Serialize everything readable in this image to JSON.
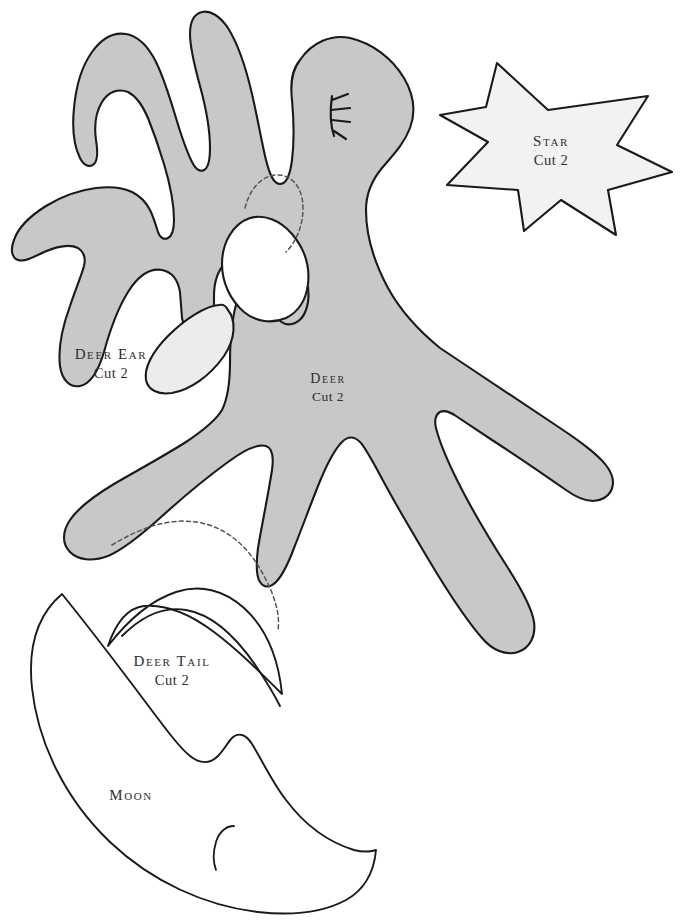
{
  "sheet": {
    "title": "Deer, Star and Moon Sewing Pattern Sheet",
    "background_color": "#ffffff",
    "width": 680,
    "height": 920
  },
  "style": {
    "outline_color": "#1a1a1a",
    "body_fill": "#c8c8c8",
    "ear_fill": "#ececec",
    "star_fill": "#f2f2f2",
    "open_fill": "#ffffff",
    "dashed_color": "#555555",
    "label_color": "#2e2e2e"
  },
  "pieces": [
    {
      "id": "deer",
      "name": "deer-body-piece",
      "label": "Deer",
      "cut": "Cut 2",
      "fill": "#c8c8c8",
      "label_x": 328,
      "label_y": 380
    },
    {
      "id": "deer-ear",
      "name": "deer-ear-piece",
      "label": "Deer Ear",
      "cut": "Cut 2",
      "fill": "#ececec",
      "label_x": 111,
      "label_y": 355
    },
    {
      "id": "star",
      "name": "star-piece",
      "label": "Star",
      "cut": "Cut 2",
      "fill": "#f2f2f2",
      "label_x": 551,
      "label_y": 142
    },
    {
      "id": "deer-tail",
      "name": "deer-tail-piece",
      "label": "Deer Tail",
      "cut": "Cut 2",
      "fill": "#ffffff",
      "label_x": 172,
      "label_y": 662
    },
    {
      "id": "moon",
      "name": "moon-piece",
      "label": "Moon",
      "cut": "",
      "fill": "#ffffff",
      "label_x": 131,
      "label_y": 796
    }
  ],
  "markings": {
    "eye": "closed-eye-with-lashes",
    "ear_placement_guide": "dashed-curve",
    "tail_placement_guide": "dashed-curve",
    "moon_inner_mark": "small-arc"
  }
}
